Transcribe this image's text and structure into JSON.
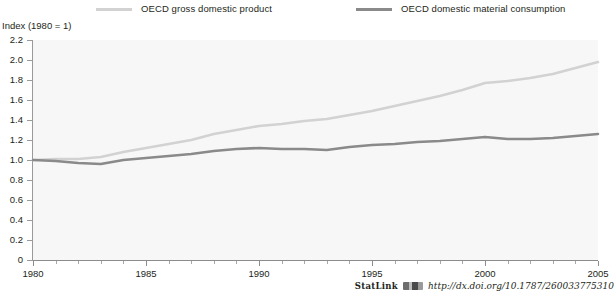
{
  "legend": {
    "position": "top",
    "items": [
      {
        "label": "OECD gross domestic product",
        "color": "#d2d2d2",
        "key": "gdp"
      },
      {
        "label": "OECD domestic material consumption",
        "color": "#8a8a8a",
        "key": "dmc"
      }
    ]
  },
  "axis_title": "Index (1980 = 1)",
  "statlink": {
    "word": "StatLink",
    "url": "http://dx.doi.org/10.1787/260033775310"
  },
  "chart_data": {
    "type": "line",
    "title": "",
    "subtitle": "",
    "xlabel": "",
    "ylabel": "Index (1980 = 1)",
    "xlim": [
      1980,
      2005
    ],
    "ylim": [
      0,
      2.2
    ],
    "ytick_step": 0.2,
    "yticks": [
      "0",
      "0.2",
      "0.4",
      "0.6",
      "0.8",
      "1.0",
      "1.2",
      "1.4",
      "1.6",
      "1.8",
      "2.0",
      "2.2"
    ],
    "ytick_values": [
      0,
      0.2,
      0.4,
      0.6,
      0.8,
      1.0,
      1.2,
      1.4,
      1.6,
      1.8,
      2.0,
      2.2
    ],
    "xticks": [
      "1980",
      "1985",
      "1990",
      "1995",
      "2000",
      "2005"
    ],
    "xtick_values": [
      1980,
      1985,
      1990,
      1995,
      2000,
      2005
    ],
    "xtick_minor_step": 1,
    "grid": false,
    "legend_position": "top",
    "x": [
      1980,
      1981,
      1982,
      1983,
      1984,
      1985,
      1986,
      1987,
      1988,
      1989,
      1990,
      1991,
      1992,
      1993,
      1994,
      1995,
      1996,
      1997,
      1998,
      1999,
      2000,
      2001,
      2002,
      2003,
      2004,
      2005
    ],
    "series": [
      {
        "name": "OECD gross domestic product",
        "color": "#d2d2d2",
        "values": [
          1.0,
          1.01,
          1.01,
          1.03,
          1.08,
          1.12,
          1.16,
          1.2,
          1.26,
          1.3,
          1.34,
          1.36,
          1.39,
          1.41,
          1.45,
          1.49,
          1.54,
          1.59,
          1.64,
          1.7,
          1.77,
          1.79,
          1.82,
          1.86,
          1.92,
          1.98
        ]
      },
      {
        "name": "OECD domestic material consumption",
        "color": "#8a8a8a",
        "values": [
          1.0,
          0.99,
          0.97,
          0.96,
          1.0,
          1.02,
          1.04,
          1.06,
          1.09,
          1.11,
          1.12,
          1.11,
          1.11,
          1.1,
          1.13,
          1.15,
          1.16,
          1.18,
          1.19,
          1.21,
          1.23,
          1.21,
          1.21,
          1.22,
          1.24,
          1.26
        ]
      }
    ]
  }
}
